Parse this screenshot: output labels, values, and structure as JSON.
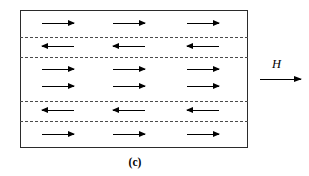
{
  "figure": {
    "caption": "(c)",
    "type": "magnetic-domain-diagram",
    "specimen": {
      "x": 20,
      "y": 10,
      "width": 228,
      "height": 138,
      "border_color": "#2b2b2b"
    },
    "field": {
      "label": "H",
      "direction": "right",
      "arrow_color": "#000000"
    },
    "domain_walls": {
      "color": "#4a4a4a",
      "style": "dashed",
      "positions_y": [
        37,
        57,
        101,
        121
      ]
    },
    "arrow_columns_x": [
      42,
      113,
      187
    ],
    "arrow_length": 32,
    "arrow_color": "#000000",
    "domains": [
      {
        "index": 0,
        "band_top": 10,
        "band_bottom": 37,
        "direction": "right",
        "rows_y": [
          24
        ],
        "arrow_count": 3
      },
      {
        "index": 1,
        "band_top": 37,
        "band_bottom": 57,
        "direction": "left",
        "rows_y": [
          47
        ],
        "arrow_count": 3
      },
      {
        "index": 2,
        "band_top": 57,
        "band_bottom": 101,
        "direction": "right",
        "rows_y": [
          70,
          87
        ],
        "arrow_count": 6
      },
      {
        "index": 3,
        "band_top": 101,
        "band_bottom": 121,
        "direction": "left",
        "rows_y": [
          111
        ],
        "arrow_count": 3
      },
      {
        "index": 4,
        "band_top": 121,
        "band_bottom": 148,
        "direction": "right",
        "rows_y": [
          135
        ],
        "arrow_count": 3
      }
    ]
  }
}
